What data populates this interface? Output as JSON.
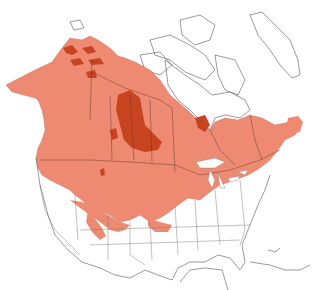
{
  "map": {
    "region": "North America",
    "type": "species range map",
    "legend": [],
    "colors": {
      "background": "#ffffff",
      "land": "#ffffff",
      "coastline": "#555555",
      "range_primary": "#ef8a72",
      "range_dense": "#c8431f",
      "borders": "#6a3a2e"
    },
    "range_areas": [
      {
        "name": "primary-range",
        "extent": "Alaska, western & central Canada, southern Canada to Atlantic provinces, northern & western United States"
      },
      {
        "name": "dense-range",
        "extent": "Northern Alaska patches, central Canadian prairies/boreal, James Bay area"
      }
    ]
  }
}
